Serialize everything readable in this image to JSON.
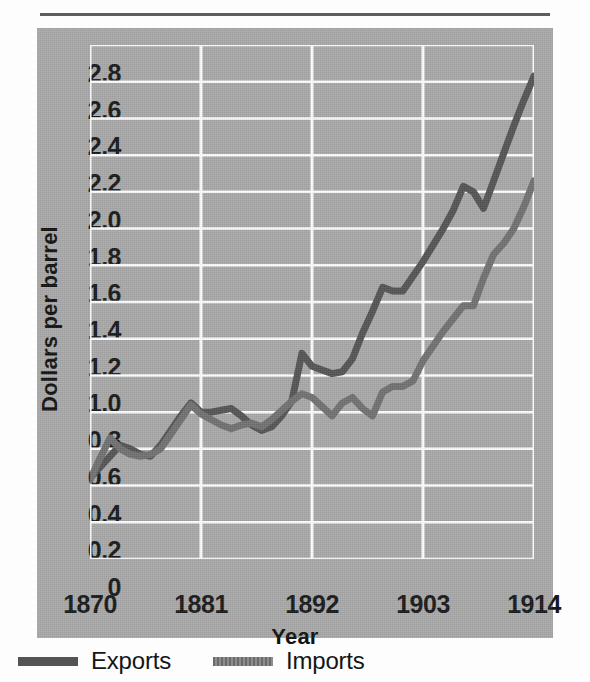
{
  "figure": {
    "background_color": "#a9a9a9",
    "gridline_color": "#ffffff"
  },
  "legend": {
    "position": "below-plot",
    "items": [
      {
        "label": "Exports",
        "color": "#545454",
        "swatch": "solid-line-swatch"
      },
      {
        "label": "Imports",
        "color": "#717171",
        "swatch": "dotted-line-swatch"
      }
    ]
  },
  "chart_data": {
    "type": "line",
    "title": "",
    "xlabel": "Year",
    "ylabel": "Dollars per barrel",
    "xlim": [
      1870,
      1914
    ],
    "ylim": [
      0,
      2.8
    ],
    "grid": true,
    "xticks": [
      "1870",
      "1881",
      "1892",
      "1903",
      "1914"
    ],
    "xtick_values": [
      1870,
      1881,
      1892,
      1903,
      1914
    ],
    "yticks": [
      "0",
      "0.2",
      "0.4",
      "0.6",
      "0.8",
      "1.0",
      "1.2",
      "1.4",
      "1.6",
      "1.8",
      "2.0",
      "2.2",
      "2.4",
      "2.6",
      "2.8"
    ],
    "ytick_values": [
      0,
      0.2,
      0.4,
      0.6,
      0.8,
      1.0,
      1.2,
      1.4,
      1.6,
      1.8,
      2.0,
      2.2,
      2.4,
      2.6,
      2.8
    ],
    "x": [
      1870,
      1871,
      1872,
      1873,
      1874,
      1875,
      1876,
      1877,
      1878,
      1879,
      1880,
      1881,
      1882,
      1883,
      1884,
      1885,
      1886,
      1887,
      1888,
      1889,
      1890,
      1891,
      1892,
      1893,
      1894,
      1895,
      1896,
      1897,
      1898,
      1899,
      1900,
      1901,
      1902,
      1903,
      1904,
      1905,
      1906,
      1907,
      1908,
      1909,
      1910,
      1911,
      1912,
      1913,
      1914
    ],
    "series": [
      {
        "name": "Exports",
        "color": "#545454",
        "values": [
          0.44,
          0.5,
          0.56,
          0.62,
          0.6,
          0.57,
          0.56,
          0.62,
          0.7,
          0.78,
          0.85,
          0.8,
          0.8,
          0.81,
          0.82,
          0.78,
          0.73,
          0.7,
          0.72,
          0.78,
          0.86,
          1.12,
          1.05,
          1.03,
          1.01,
          1.02,
          1.09,
          1.23,
          1.35,
          1.48,
          1.46,
          1.46,
          1.54,
          1.62,
          1.71,
          1.8,
          1.9,
          2.03,
          2.0,
          1.91,
          2.06,
          2.21,
          2.36,
          2.5,
          2.63
        ]
      },
      {
        "name": "Imports",
        "color": "#717171",
        "values": [
          0.43,
          0.55,
          0.66,
          0.6,
          0.57,
          0.56,
          0.57,
          0.6,
          0.68,
          0.76,
          0.84,
          0.79,
          0.76,
          0.73,
          0.71,
          0.73,
          0.74,
          0.72,
          0.76,
          0.81,
          0.86,
          0.9,
          0.88,
          0.83,
          0.78,
          0.85,
          0.88,
          0.82,
          0.78,
          0.91,
          0.94,
          0.94,
          0.97,
          1.08,
          1.16,
          1.24,
          1.31,
          1.38,
          1.38,
          1.53,
          1.66,
          1.72,
          1.8,
          1.92,
          2.06
        ]
      }
    ]
  }
}
